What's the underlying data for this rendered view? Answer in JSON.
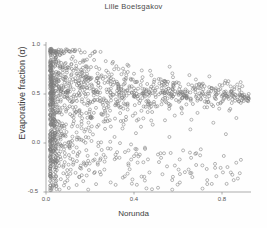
{
  "chart_data": {
    "type": "scatter",
    "title": "Lille Boelsgakov",
    "xlabel": "Norunda",
    "ylabel": "Evaporative fraction (α)",
    "xlim": [
      -0.02,
      0.96
    ],
    "ylim": [
      -0.5,
      1.05
    ],
    "xticks": [
      0.0,
      0.4,
      0.8
    ],
    "xticklabels": [
      "0.0",
      "0.4",
      "0.8"
    ],
    "yticks": [
      1.0,
      0.5,
      0.0,
      -0.5
    ],
    "yticklabels": [
      "1.0",
      "0.5",
      "0.0",
      "-0.5"
    ],
    "grid": false,
    "legend": null,
    "marker": {
      "style": "open-circle",
      "radius_px": 1.5,
      "edge_color": "#7d7d7d",
      "fill": "none",
      "line_width": 0.55
    },
    "axis_color": "#8a8a8a",
    "point_count": 1180,
    "points": [
      [
        0.002,
        0.98
      ],
      [
        0.003,
        0.95
      ],
      [
        0.004,
        0.92
      ],
      [
        0.002,
        0.89
      ],
      [
        0.005,
        0.87
      ],
      [
        0.003,
        0.84
      ],
      [
        0.006,
        0.82
      ],
      [
        0.004,
        0.8
      ],
      [
        0.007,
        0.78
      ],
      [
        0.005,
        0.76
      ],
      [
        0.008,
        0.74
      ],
      [
        0.006,
        0.72
      ],
      [
        0.009,
        0.7
      ],
      [
        0.007,
        0.68
      ],
      [
        0.01,
        0.66
      ],
      [
        0.008,
        0.64
      ],
      [
        0.011,
        0.62
      ],
      [
        0.009,
        0.6
      ],
      [
        0.012,
        0.58
      ],
      [
        0.01,
        0.56
      ],
      [
        0.013,
        0.54
      ],
      [
        0.011,
        0.52
      ],
      [
        0.014,
        0.5
      ],
      [
        0.012,
        0.48
      ],
      [
        0.015,
        0.46
      ],
      [
        0.013,
        0.44
      ],
      [
        0.016,
        0.42
      ],
      [
        0.014,
        0.4
      ],
      [
        0.017,
        0.38
      ],
      [
        0.015,
        0.36
      ],
      [
        0.018,
        0.34
      ],
      [
        0.016,
        0.32
      ],
      [
        0.019,
        0.3
      ],
      [
        0.017,
        0.28
      ],
      [
        0.02,
        0.26
      ],
      [
        0.018,
        0.24
      ],
      [
        0.021,
        0.22
      ],
      [
        0.019,
        0.2
      ],
      [
        0.022,
        0.18
      ],
      [
        0.02,
        0.15
      ],
      [
        0.023,
        0.12
      ],
      [
        0.021,
        0.09
      ],
      [
        0.024,
        0.05
      ],
      [
        0.022,
        0.01
      ],
      [
        0.025,
        -0.04
      ],
      [
        0.023,
        -0.09
      ],
      [
        0.026,
        -0.14
      ],
      [
        0.024,
        -0.19
      ],
      [
        0.027,
        -0.24
      ],
      [
        0.025,
        -0.29
      ],
      [
        0.028,
        -0.34
      ],
      [
        0.026,
        -0.39
      ],
      [
        0.029,
        -0.44
      ],
      [
        0.03,
        -0.47
      ],
      [
        0.04,
        0.88
      ],
      [
        0.05,
        0.82
      ],
      [
        0.06,
        0.79
      ],
      [
        0.07,
        0.85
      ],
      [
        0.08,
        0.76
      ],
      [
        0.09,
        0.81
      ],
      [
        0.1,
        0.73
      ],
      [
        0.11,
        0.78
      ],
      [
        0.12,
        0.7
      ],
      [
        0.13,
        0.75
      ],
      [
        0.14,
        0.68
      ],
      [
        0.15,
        0.72
      ],
      [
        0.16,
        0.66
      ],
      [
        0.17,
        0.71
      ],
      [
        0.18,
        0.64
      ],
      [
        0.19,
        0.69
      ],
      [
        0.2,
        0.62
      ],
      [
        0.22,
        0.67
      ],
      [
        0.24,
        0.6
      ],
      [
        0.26,
        0.65
      ],
      [
        0.28,
        0.58
      ],
      [
        0.3,
        0.63
      ],
      [
        0.32,
        0.57
      ],
      [
        0.34,
        0.61
      ],
      [
        0.36,
        0.56
      ],
      [
        0.38,
        0.6
      ],
      [
        0.4,
        0.55
      ],
      [
        0.42,
        0.59
      ],
      [
        0.44,
        0.54
      ],
      [
        0.46,
        0.58
      ],
      [
        0.48,
        0.54
      ],
      [
        0.5,
        0.57
      ],
      [
        0.52,
        0.53
      ],
      [
        0.55,
        0.56
      ],
      [
        0.58,
        0.53
      ],
      [
        0.61,
        0.55
      ],
      [
        0.64,
        0.52
      ],
      [
        0.67,
        0.55
      ],
      [
        0.7,
        0.52
      ],
      [
        0.73,
        0.54
      ],
      [
        0.76,
        0.51
      ],
      [
        0.79,
        0.54
      ],
      [
        0.82,
        0.51
      ],
      [
        0.85,
        0.53
      ],
      [
        0.88,
        0.5
      ],
      [
        0.91,
        0.52
      ],
      [
        0.93,
        0.49
      ],
      [
        0.05,
        0.18
      ],
      [
        0.07,
        0.1
      ],
      [
        0.09,
        -0.02
      ],
      [
        0.11,
        0.22
      ],
      [
        0.13,
        -0.12
      ],
      [
        0.15,
        0.05
      ],
      [
        0.17,
        -0.22
      ],
      [
        0.19,
        0.14
      ],
      [
        0.21,
        -0.3
      ],
      [
        0.23,
        0.02
      ],
      [
        0.26,
        -0.18
      ],
      [
        0.29,
        0.19
      ],
      [
        0.32,
        -0.08
      ],
      [
        0.35,
        0.25
      ],
      [
        0.38,
        -0.26
      ],
      [
        0.41,
        0.12
      ],
      [
        0.45,
        -0.34
      ],
      [
        0.49,
        0.21
      ],
      [
        0.53,
        -0.14
      ],
      [
        0.57,
        0.08
      ],
      [
        0.62,
        -0.4
      ],
      [
        0.67,
        0.16
      ],
      [
        0.72,
        -0.05
      ],
      [
        0.78,
        0.23
      ],
      [
        0.84,
        0.11
      ],
      [
        0.89,
        0.28
      ]
    ]
  }
}
